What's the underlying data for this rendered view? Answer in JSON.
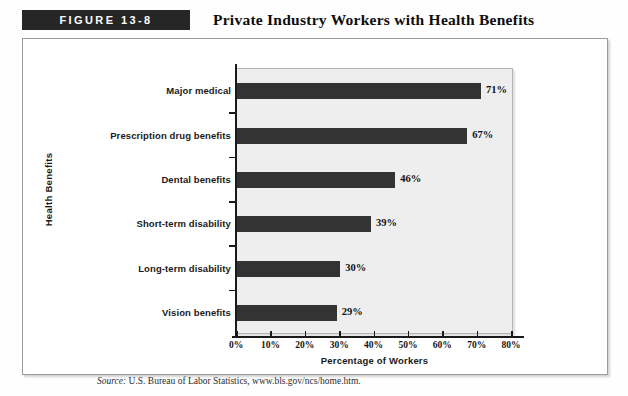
{
  "figure": {
    "badge": "FIGURE 13-8",
    "title": "Private Industry Workers with Health Benefits",
    "badge_bg": "#262626",
    "badge_fg": "#ffffff"
  },
  "source": {
    "prefix": "Source:",
    "text": " U.S. Bureau of Labor Statistics, www.bls.gov/ncs/home.htm."
  },
  "chart_data": {
    "type": "bar",
    "orientation": "horizontal",
    "title": "Private Industry Workers with Health Benefits",
    "xlabel": "Percentage of Workers",
    "ylabel": "Health Benefits",
    "categories": [
      "Major medical",
      "Prescription drug benefits",
      "Dental benefits",
      "Short-term disability",
      "Long-term disability",
      "Vision benefits"
    ],
    "values": [
      71,
      67,
      46,
      39,
      30,
      29
    ],
    "value_labels": [
      "71%",
      "67%",
      "46%",
      "39%",
      "30%",
      "29%"
    ],
    "xlim": [
      0,
      80
    ],
    "xticks": [
      0,
      10,
      20,
      30,
      40,
      50,
      60,
      70,
      80
    ],
    "xtick_labels": [
      "0%",
      "10%",
      "20%",
      "30%",
      "40%",
      "50%",
      "60%",
      "70%",
      "80%"
    ],
    "grid": false,
    "legend": null,
    "bar_color": "#333333",
    "plot_bg": "#eeeeee"
  }
}
